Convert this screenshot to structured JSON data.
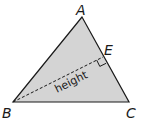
{
  "diagram": {
    "type": "geometry-triangle",
    "fill_color": "#d4d4d4",
    "stroke_color": "#1a1a1a",
    "vertices": [
      {
        "label": "A",
        "x": 82,
        "y": 17
      },
      {
        "label": "B",
        "x": 13,
        "y": 102
      },
      {
        "label": "C",
        "x": 129,
        "y": 102
      }
    ],
    "foot": {
      "label": "E",
      "x": 103,
      "y": 57
    },
    "height_label": "height",
    "labels": {
      "A": "A",
      "B": "B",
      "C": "C",
      "E": "E",
      "height": "height"
    }
  }
}
